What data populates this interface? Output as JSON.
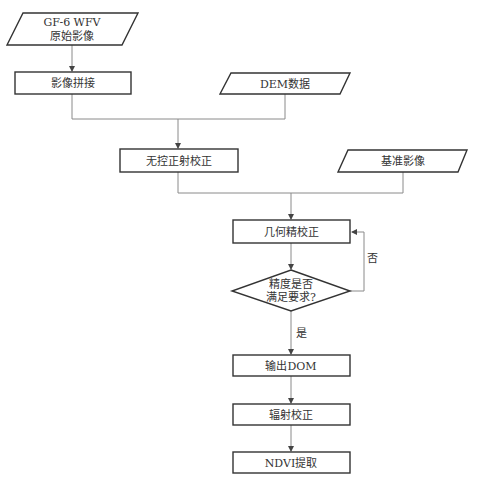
{
  "nodes": {
    "raw_image": {
      "line1": "GF-6 WFV",
      "line2": "原始影像",
      "shape": "parallelogram"
    },
    "mosaic": {
      "label": "影像拼接",
      "shape": "rectangle"
    },
    "dem": {
      "label": "DEM数据",
      "shape": "parallelogram"
    },
    "ortho": {
      "label": "无控正射校正",
      "shape": "rectangle"
    },
    "reference": {
      "label": "基准影像",
      "shape": "parallelogram"
    },
    "geo_fine": {
      "label": "几何精校正",
      "shape": "rectangle"
    },
    "decision": {
      "line1": "精度是否",
      "line2": "满足要求?",
      "shape": "diamond"
    },
    "output_dom": {
      "label": "输出DOM",
      "shape": "rectangle"
    },
    "radiometric": {
      "label": "辐射校正",
      "shape": "rectangle"
    },
    "ndvi": {
      "label": "NDVI提取",
      "shape": "rectangle"
    }
  },
  "edge_labels": {
    "no": "否",
    "yes": "是"
  },
  "colors": {
    "border": "#333333",
    "connector": "#8a8a8a",
    "text": "#333333",
    "background": "#ffffff"
  }
}
